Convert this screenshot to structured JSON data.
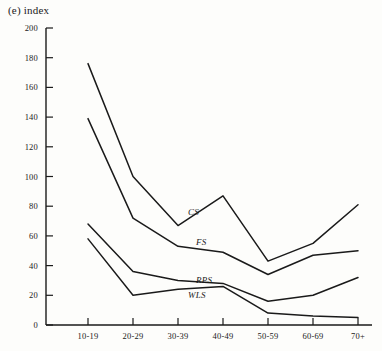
{
  "chart_data": {
    "type": "line",
    "title": "(e) index",
    "xlabel": "",
    "ylabel": "index",
    "categories": [
      "10-19",
      "20-29",
      "30-39",
      "40-49",
      "50-59",
      "60-69",
      "70+"
    ],
    "ylim": [
      0,
      200
    ],
    "yticks": [
      0,
      20,
      40,
      60,
      80,
      100,
      120,
      140,
      160,
      180,
      200
    ],
    "grid": false,
    "legend_position": "inline-annotations",
    "series": [
      {
        "name": "CS",
        "label": "CS",
        "values": [
          176,
          100,
          67,
          87,
          43,
          55,
          81
        ]
      },
      {
        "name": "FS",
        "label": "FS",
        "values": [
          139,
          72,
          53,
          49,
          34,
          47,
          50
        ]
      },
      {
        "name": "RPS",
        "label": "RPS",
        "values": [
          68,
          36,
          30,
          28,
          16,
          20,
          32
        ]
      },
      {
        "name": "WLS",
        "label": "WLS",
        "values": [
          58,
          20,
          24,
          26,
          8,
          6,
          5
        ]
      }
    ],
    "annotations": [
      {
        "text": "CS",
        "x_px": 188,
        "y_px": 207
      },
      {
        "text": "FS",
        "x_px": 196,
        "y_px": 237
      },
      {
        "text": "RPS",
        "x_px": 196,
        "y_px": 275
      },
      {
        "text": "WLS",
        "x_px": 188,
        "y_px": 290
      }
    ]
  }
}
